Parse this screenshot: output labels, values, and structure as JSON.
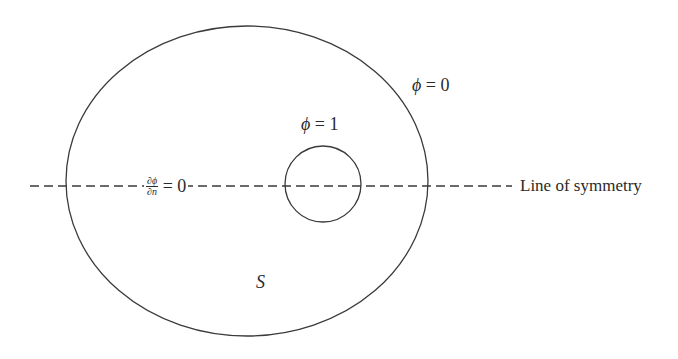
{
  "diagram": {
    "outer_boundary": {
      "shape": "ellipse",
      "cx": 247,
      "cy": 181,
      "rx": 181,
      "ry": 155,
      "stroke": "#3a3a3a"
    },
    "inner_boundary": {
      "shape": "circle",
      "cx": 323,
      "cy": 184,
      "r": 38,
      "stroke": "#3a3a3a"
    },
    "symmetry_line": {
      "x1": 30,
      "x2": 512,
      "y": 186,
      "dash": "9 5",
      "stroke": "#3a3a3a"
    },
    "labels": {
      "outer_condition": {
        "symbol": "ϕ",
        "rest": " = 0"
      },
      "inner_condition": {
        "symbol": "ϕ",
        "rest": " = 1"
      },
      "neumann_condition": {
        "numerator": "∂ϕ",
        "denominator": "∂n",
        "rest": " = 0"
      },
      "region": "S",
      "symmetry": "Line of symmetry"
    }
  }
}
